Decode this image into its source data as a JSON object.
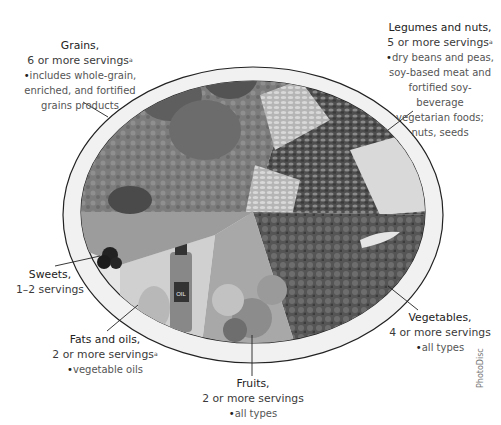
{
  "diagram": {
    "type": "food-guide-plate",
    "center_label": "",
    "colors": {
      "plate_fill": "#f2f2f2",
      "plate_rim": "#222222",
      "grains": "#7a7a7a",
      "legumes": "#6a6a6a",
      "vegetables": "#5c5c5c",
      "fruits": "#9a9a9a",
      "fats": "#c4c4c4",
      "sweets": "#8a8a8a"
    }
  },
  "labels": {
    "grains": {
      "title": "Grains,",
      "servings": "6 or more servings",
      "footnote": "a",
      "details": [
        "includes whole-grain,",
        "enriched, and fortified",
        "grains products"
      ]
    },
    "legumes": {
      "title": "Legumes and nuts,",
      "servings": "5 or more servings",
      "footnote": "a",
      "details": [
        "dry beans and peas,",
        "soy-based meat and",
        "fortified soy-beverage",
        "vegetarian foods;",
        "nuts, seeds"
      ]
    },
    "sweets": {
      "title": "Sweets,",
      "servings": "1–2 servings"
    },
    "fats": {
      "title": "Fats and oils,",
      "servings": "2 or more servings",
      "footnote": "a",
      "details": [
        "vegetable oils"
      ]
    },
    "fruits": {
      "title": "Fruits,",
      "servings": "2 or more servings",
      "details": [
        "all types"
      ]
    },
    "vegetables": {
      "title": "Vegetables,",
      "servings": "4 or more servings",
      "details": [
        "all types"
      ]
    }
  },
  "bottle_label": "OIL",
  "credit": "PhotoDisc"
}
